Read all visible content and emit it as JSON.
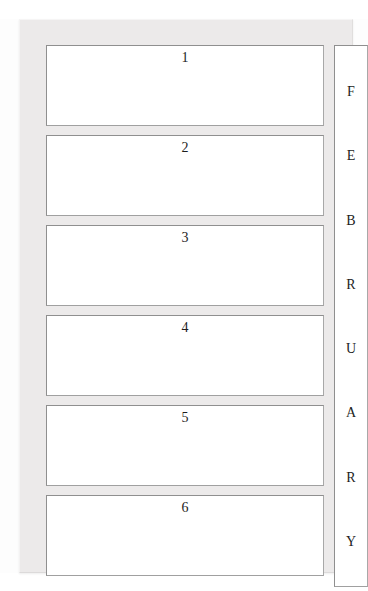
{
  "document": {
    "type": "planner-page",
    "month_label": "FEBRUARY",
    "colors": {
      "paper": "#fdfdfd",
      "frame": "#eceaea",
      "box_border": "#8f8f8f",
      "box_fill": "#ffffff",
      "text": "#1d1d1d"
    }
  },
  "day_boxes": [
    {
      "number": "1"
    },
    {
      "number": "2"
    },
    {
      "number": "3"
    },
    {
      "number": "4"
    },
    {
      "number": "5"
    },
    {
      "number": "6"
    }
  ],
  "month_strip": {
    "letters": [
      {
        "char": "F"
      },
      {
        "char": "E"
      },
      {
        "char": "B"
      },
      {
        "char": "R"
      },
      {
        "char": "U"
      },
      {
        "char": "A"
      },
      {
        "char": "R"
      },
      {
        "char": "Y"
      }
    ]
  }
}
